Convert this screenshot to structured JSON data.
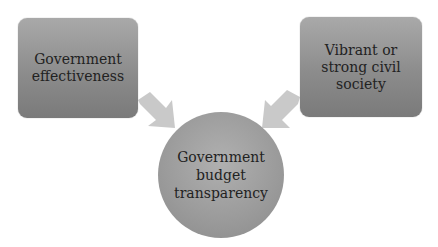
{
  "diagram": {
    "nodes": [
      {
        "id": "left",
        "label": "Government\neffectiveness"
      },
      {
        "id": "right",
        "label": "Vibrant or\nstrong civil\nsociety"
      },
      {
        "id": "center",
        "label": "Government\nbudget\ntransparency"
      }
    ],
    "edges": [
      {
        "from": "left",
        "to": "center"
      },
      {
        "from": "right",
        "to": "center"
      }
    ],
    "colors": {
      "box": "#8c8c8c",
      "arrow": "#c8c8c8",
      "circle": "#9a9a9a",
      "text": "#222222"
    }
  }
}
